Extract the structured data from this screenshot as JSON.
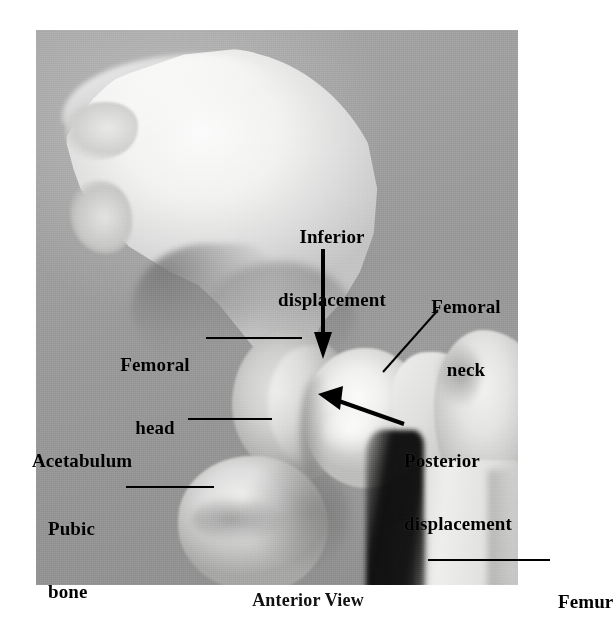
{
  "figure": {
    "caption": "Anterior View",
    "photo": {
      "description": "Grayscale photograph of a dislocated hip joint specimen",
      "background_color": "#9b9b9b",
      "bone_color": "#f2f2f0",
      "shadow_color": "#101010"
    },
    "annotation_color": "#000000"
  },
  "labels": {
    "inferior_displacement": {
      "line1": "Inferior",
      "line2": "displacement"
    },
    "femoral_neck": {
      "line1": "Femoral",
      "line2": "neck"
    },
    "femoral_head": {
      "line1": "Femoral",
      "line2": "head"
    },
    "acetabulum": {
      "line1": "Acetabulum"
    },
    "pubic_bone": {
      "line1": "Pubic",
      "line2": "bone"
    },
    "posterior_displacement": {
      "line1": "Posterior",
      "line2": "displacement"
    },
    "femur": {
      "line1": "Femur"
    }
  }
}
